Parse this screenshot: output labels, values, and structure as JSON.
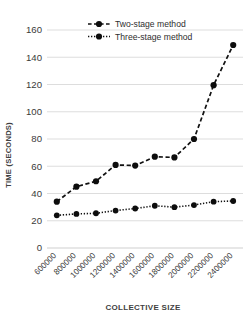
{
  "chart_data": {
    "type": "line",
    "title": "",
    "xlabel": "COLLECTIVE SIZE",
    "ylabel": "TIME (SECONDS)",
    "categories": [
      "600000",
      "800000",
      "1000000",
      "1200000",
      "1400000",
      "1600000",
      "1800000",
      "2000000",
      "2200000",
      "2400000"
    ],
    "series": [
      {
        "name": "Two-stage method",
        "style": "dashed",
        "marker": "circle",
        "values": [
          34,
          45,
          49,
          61,
          60.5,
          67,
          66.5,
          80,
          119.5,
          149
        ]
      },
      {
        "name": "Three-stage method",
        "style": "dotted",
        "marker": "circle",
        "values": [
          24,
          25,
          25.5,
          27.5,
          29,
          31,
          30,
          31.5,
          34,
          34.5
        ]
      }
    ],
    "ylim": [
      0,
      160
    ],
    "yticks": [
      0,
      20,
      40,
      60,
      80,
      100,
      120,
      140,
      160
    ],
    "ytick_labels": [
      "0",
      "20",
      "40",
      "60",
      "80",
      "100",
      "120",
      "140",
      "160"
    ],
    "grid": true,
    "grid_axis": "y",
    "legend_position": "top-center",
    "colors": {
      "series": "#111111",
      "grid": "#d9d9d9",
      "text": "#3a3a3a",
      "background": "#ffffff"
    }
  },
  "legend": {
    "items": [
      {
        "label": "Two-stage method"
      },
      {
        "label": "Three-stage method"
      }
    ]
  },
  "axes": {
    "y_title": "TIME (SECONDS)",
    "x_title": "COLLECTIVE SIZE"
  }
}
